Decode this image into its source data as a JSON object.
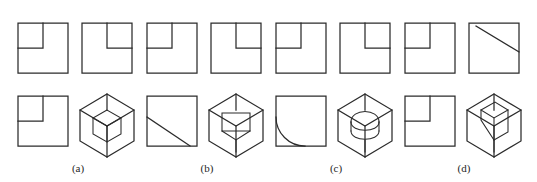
{
  "page": {
    "width": 537,
    "height": 182,
    "background_color": "#ffffff",
    "stroke_color": "#2b2b2b",
    "clipped_header_text": "‑ ‑ ‑ ‑ ‑ ‑ ‑ ‑ ‑ ‑ ‑ ‑ ‑ ‑ ‑ ‑ ‑ ‑ ‑ ‑ ‑ ‑ ‑ ‑"
  },
  "figure": {
    "kind": "engineering-drawing-multiple-choice",
    "row_top_label": "",
    "row_bottom_label": "",
    "top_row_count": 8,
    "bottom_row_count": 8
  },
  "top_row": {
    "name": "orthographic-view-row",
    "items": [
      {
        "id": "top-1",
        "type": "square-with-notch",
        "notch_corner": "top-left",
        "cx": 43,
        "cy": 48
      },
      {
        "id": "top-2",
        "type": "square-with-notch",
        "notch_corner": "top-right",
        "cx": 107,
        "cy": 48
      },
      {
        "id": "top-3",
        "type": "square-with-notch",
        "notch_corner": "top-left",
        "cx": 172,
        "cy": 48
      },
      {
        "id": "top-4",
        "type": "square-with-notch",
        "notch_corner": "top-right",
        "cx": 236,
        "cy": 48
      },
      {
        "id": "top-5",
        "type": "square-with-notch",
        "notch_corner": "top-left",
        "cx": 301,
        "cy": 48
      },
      {
        "id": "top-6",
        "type": "square-with-notch",
        "notch_corner": "top-right",
        "cx": 365,
        "cy": 48
      },
      {
        "id": "top-7",
        "type": "square-with-notch",
        "notch_corner": "top-left",
        "cx": 430,
        "cy": 48
      },
      {
        "id": "top-8",
        "type": "square-with-diagonal",
        "diagonal": "top-right",
        "cx": 494,
        "cy": 48
      }
    ]
  },
  "bottom_row": {
    "name": "pictorial-view-row",
    "items": [
      {
        "id": "bot-1",
        "type": "square-with-notch",
        "notch_corner": "top-left",
        "cx": 43,
        "cy": 121
      },
      {
        "id": "bot-2",
        "type": "cube-corner-notch",
        "cx": 107,
        "cy": 121
      },
      {
        "id": "bot-3",
        "type": "square-with-diagonal",
        "diagonal": "bottom-left",
        "cx": 172,
        "cy": 121
      },
      {
        "id": "bot-4",
        "type": "cube-rect-slot",
        "cx": 236,
        "cy": 121
      },
      {
        "id": "bot-5",
        "type": "square-with-arc",
        "arc_corner": "bottom-left",
        "cx": 301,
        "cy": 121
      },
      {
        "id": "bot-6",
        "type": "cube-round-slot",
        "cx": 365,
        "cy": 121
      },
      {
        "id": "bot-7",
        "type": "square-with-notch",
        "notch_corner": "top-left",
        "cx": 430,
        "cy": 121
      },
      {
        "id": "bot-8",
        "type": "cube-angled-cut",
        "cx": 494,
        "cy": 121
      }
    ]
  },
  "captions": {
    "items": [
      {
        "id": "caption-a",
        "label": "(a)",
        "x": 78,
        "y": 162
      },
      {
        "id": "caption-b",
        "label": "(b)",
        "x": 207,
        "y": 162
      },
      {
        "id": "caption-c",
        "label": "(c)",
        "x": 336,
        "y": 162
      },
      {
        "id": "caption-d",
        "label": "(d)",
        "x": 464,
        "y": 162
      }
    ]
  }
}
